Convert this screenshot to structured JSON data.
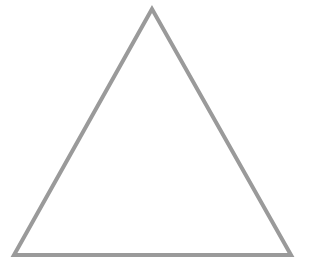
{
  "diagram": {
    "shape": "triangle",
    "kind": "equilateral-outline",
    "fill": "none",
    "stroke_color": "#9a9a9a",
    "stroke_width": 4,
    "vertices": {
      "apex": [
        152,
        9
      ],
      "bottom_left": [
        14,
        255
      ],
      "bottom_right": [
        291,
        255
      ]
    },
    "background_color": "#ffffff"
  }
}
